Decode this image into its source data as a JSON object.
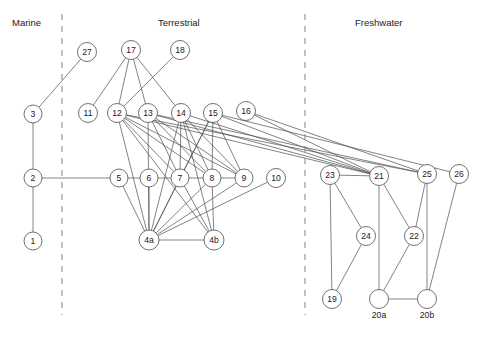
{
  "figure": {
    "type": "network-diagram",
    "title": "",
    "background": "#ffffff",
    "stroke_color": "#4d4d4d",
    "node_fill": "#ffffff",
    "text_color": "#1a1a1a",
    "width": 483,
    "height": 339
  },
  "habitat_labels": [
    {
      "name": "marine-label",
      "text": "Marine",
      "x": 12,
      "y": 17
    },
    {
      "name": "terrestrial-label",
      "text": "Terrestrial",
      "x": 158,
      "y": 17
    },
    {
      "name": "freshwater-label",
      "text": "Freshwater",
      "x": 355,
      "y": 17
    }
  ],
  "dividers": [
    {
      "name": "divider-marine-terrestrial",
      "x": 62,
      "y1": 14,
      "y2": 315
    },
    {
      "name": "divider-terrestrial-freshwater",
      "x": 305,
      "y1": 14,
      "y2": 315
    }
  ],
  "nodes": [
    {
      "id": "1",
      "label": "1",
      "x": 33,
      "y": 241,
      "r": 9,
      "group": "marine",
      "label_below": ""
    },
    {
      "id": "2",
      "label": "2",
      "x": 33,
      "y": 178,
      "r": 9,
      "group": "marine",
      "label_below": ""
    },
    {
      "id": "3",
      "label": "3",
      "x": 33,
      "y": 114,
      "r": 9,
      "group": "marine",
      "label_below": ""
    },
    {
      "id": "27",
      "label": "27",
      "x": 87,
      "y": 52,
      "r": 9.5,
      "group": "terrestrial",
      "label_below": ""
    },
    {
      "id": "11",
      "label": "11",
      "x": 88,
      "y": 113,
      "r": 9.5,
      "group": "terrestrial",
      "label_below": ""
    },
    {
      "id": "17",
      "label": "17",
      "x": 131,
      "y": 50,
      "r": 9.5,
      "group": "terrestrial",
      "label_below": ""
    },
    {
      "id": "18",
      "label": "18",
      "x": 180,
      "y": 50,
      "r": 9.5,
      "group": "terrestrial",
      "label_below": ""
    },
    {
      "id": "12",
      "label": "12",
      "x": 117,
      "y": 113,
      "r": 9.5,
      "group": "terrestrial",
      "label_below": ""
    },
    {
      "id": "13",
      "label": "13",
      "x": 148,
      "y": 113,
      "r": 9.5,
      "group": "terrestrial",
      "label_below": ""
    },
    {
      "id": "14",
      "label": "14",
      "x": 181,
      "y": 113,
      "r": 9.5,
      "group": "terrestrial",
      "label_below": ""
    },
    {
      "id": "15",
      "label": "15",
      "x": 213,
      "y": 113,
      "r": 9.5,
      "group": "terrestrial",
      "label_below": ""
    },
    {
      "id": "16",
      "label": "16",
      "x": 246,
      "y": 111,
      "r": 9.5,
      "group": "terrestrial",
      "label_below": ""
    },
    {
      "id": "5",
      "label": "5",
      "x": 119,
      "y": 178,
      "r": 9,
      "group": "terrestrial",
      "label_below": ""
    },
    {
      "id": "6",
      "label": "6",
      "x": 149,
      "y": 178,
      "r": 9,
      "group": "terrestrial",
      "label_below": ""
    },
    {
      "id": "7",
      "label": "7",
      "x": 180,
      "y": 178,
      "r": 9,
      "group": "terrestrial",
      "label_below": ""
    },
    {
      "id": "8",
      "label": "8",
      "x": 212,
      "y": 178,
      "r": 9,
      "group": "terrestrial",
      "label_below": ""
    },
    {
      "id": "9",
      "label": "9",
      "x": 244,
      "y": 178,
      "r": 9,
      "group": "terrestrial",
      "label_below": ""
    },
    {
      "id": "10",
      "label": "10",
      "x": 276,
      "y": 178,
      "r": 9.5,
      "group": "terrestrial",
      "label_below": ""
    },
    {
      "id": "4a",
      "label": "4a",
      "x": 149,
      "y": 240,
      "r": 10,
      "group": "terrestrial",
      "label_below": ""
    },
    {
      "id": "4b",
      "label": "4b",
      "x": 214,
      "y": 240,
      "r": 10,
      "group": "terrestrial",
      "label_below": ""
    },
    {
      "id": "23",
      "label": "23",
      "x": 330,
      "y": 175,
      "r": 9.5,
      "group": "freshwater",
      "label_below": ""
    },
    {
      "id": "21",
      "label": "21",
      "x": 379,
      "y": 176,
      "r": 9.5,
      "group": "freshwater",
      "label_below": ""
    },
    {
      "id": "25",
      "label": "25",
      "x": 427,
      "y": 174,
      "r": 9.5,
      "group": "freshwater",
      "label_below": ""
    },
    {
      "id": "26",
      "label": "26",
      "x": 459,
      "y": 174,
      "r": 9.5,
      "group": "freshwater",
      "label_below": ""
    },
    {
      "id": "24",
      "label": "24",
      "x": 366,
      "y": 236,
      "r": 9.5,
      "group": "freshwater",
      "label_below": ""
    },
    {
      "id": "22",
      "label": "22",
      "x": 414,
      "y": 236,
      "r": 9.5,
      "group": "freshwater",
      "label_below": ""
    },
    {
      "id": "19",
      "label": "19",
      "x": 332,
      "y": 299,
      "r": 9.5,
      "group": "freshwater",
      "label_below": ""
    },
    {
      "id": "20a",
      "label": "",
      "x": 379,
      "y": 299,
      "r": 9.5,
      "group": "freshwater",
      "label_below": "20a"
    },
    {
      "id": "20b",
      "label": "",
      "x": 427,
      "y": 299,
      "r": 9.5,
      "group": "freshwater",
      "label_below": "20b"
    }
  ],
  "edges": [
    [
      "1",
      "2"
    ],
    [
      "2",
      "3"
    ],
    [
      "3",
      "27"
    ],
    [
      "2",
      "9"
    ],
    [
      "17",
      "11"
    ],
    [
      "17",
      "12"
    ],
    [
      "17",
      "13"
    ],
    [
      "17",
      "14"
    ],
    [
      "18",
      "12"
    ],
    [
      "12",
      "7"
    ],
    [
      "12",
      "8"
    ],
    [
      "12",
      "9"
    ],
    [
      "12",
      "4a"
    ],
    [
      "12",
      "4b"
    ],
    [
      "12",
      "21"
    ],
    [
      "12",
      "25"
    ],
    [
      "13",
      "7"
    ],
    [
      "13",
      "8"
    ],
    [
      "13",
      "9"
    ],
    [
      "13",
      "4a"
    ],
    [
      "13",
      "21"
    ],
    [
      "13",
      "25"
    ],
    [
      "14",
      "7"
    ],
    [
      "14",
      "8"
    ],
    [
      "14",
      "9"
    ],
    [
      "14",
      "4a"
    ],
    [
      "14",
      "4b"
    ],
    [
      "14",
      "21"
    ],
    [
      "15",
      "7"
    ],
    [
      "15",
      "8"
    ],
    [
      "15",
      "9"
    ],
    [
      "15",
      "4a"
    ],
    [
      "15",
      "21"
    ],
    [
      "15",
      "26"
    ],
    [
      "16",
      "21"
    ],
    [
      "16",
      "25"
    ],
    [
      "5",
      "4a"
    ],
    [
      "6",
      "4a"
    ],
    [
      "7",
      "4a"
    ],
    [
      "8",
      "4a"
    ],
    [
      "9",
      "4a"
    ],
    [
      "10",
      "4a"
    ],
    [
      "8",
      "4b"
    ],
    [
      "7",
      "4b"
    ],
    [
      "4a",
      "4b"
    ],
    [
      "23",
      "19"
    ],
    [
      "23",
      "24"
    ],
    [
      "23",
      "21"
    ],
    [
      "24",
      "19"
    ],
    [
      "21",
      "20a"
    ],
    [
      "21",
      "22"
    ],
    [
      "22",
      "20a"
    ],
    [
      "25",
      "22"
    ],
    [
      "25",
      "20b"
    ],
    [
      "26",
      "20b"
    ],
    [
      "20a",
      "20b"
    ]
  ]
}
